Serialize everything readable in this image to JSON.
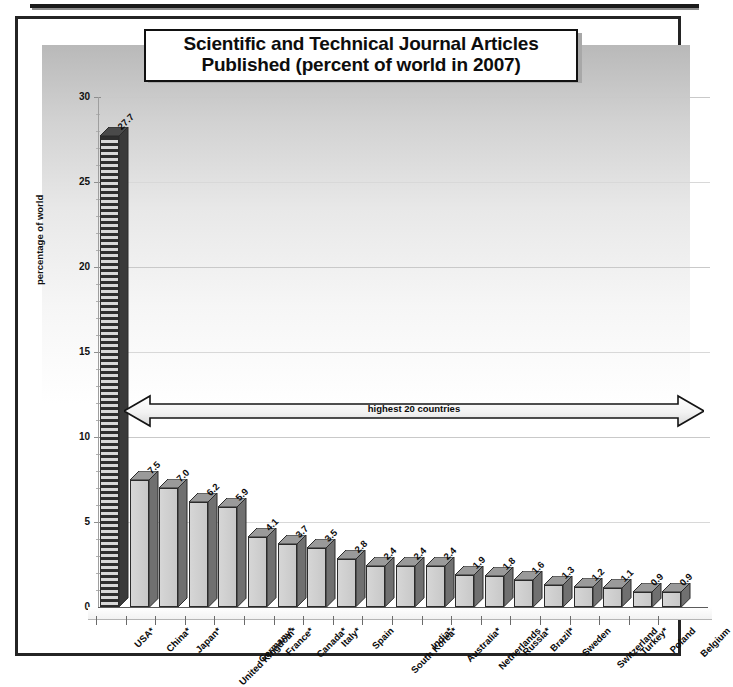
{
  "figure": {
    "title_line1": "Scientific and Technical Journal Articles",
    "title_line2": "Published (percent of world in 2007)",
    "annotation": "highest 20 countries",
    "bottom_caption": "",
    "colors": {
      "bar_face": "#d0d0d0",
      "bar_side": "#6e6e6e",
      "bar_outline": "#2b2b2b",
      "text": "#0b0b0b",
      "frame": "#242424",
      "gridline": "#c9c9c9"
    }
  },
  "chart_data": {
    "type": "bar",
    "title": "Scientific and Technical Journal Articles Published (percent of world in 2007)",
    "xlabel": "",
    "ylabel": "percentage of world",
    "ylim": [
      0,
      30
    ],
    "yticks": [
      0,
      5,
      10,
      15,
      20,
      25,
      30
    ],
    "grid": true,
    "legend": "none",
    "annotations": [
      "highest 20 countries"
    ],
    "categories": [
      "USA*",
      "China*",
      "Japan*",
      "United Kingdom*",
      "Germany*",
      "France*",
      "Canada*",
      "Italy*",
      "Spain",
      "South Korea*",
      "India*",
      "Australia*",
      "Netherlands",
      "Russia*",
      "Brazil*",
      "Sweden",
      "Switzerland",
      "Turkey*",
      "Poland",
      "Belgium"
    ],
    "values": [
      27.7,
      7.5,
      7.0,
      6.2,
      5.9,
      4.1,
      3.7,
      3.5,
      2.8,
      2.4,
      2.4,
      2.4,
      1.9,
      1.8,
      1.6,
      1.3,
      1.2,
      1.1,
      0.9,
      0.9
    ],
    "value_labels": [
      "27.7",
      "7.5",
      "7.0",
      "6.2",
      "5.9",
      "4.1",
      "3.7",
      "3.5",
      "2.8",
      "2.4",
      "2.4",
      "2.4",
      "1.9",
      "1.8",
      "1.6",
      "1.3",
      "1.2",
      "1.1",
      "0.9",
      "0.9"
    ],
    "highlighted_index": 0
  }
}
